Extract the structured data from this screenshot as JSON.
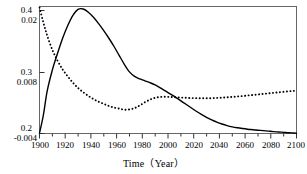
{
  "chart_data": {
    "type": "line",
    "title": "",
    "xlabel": "Time（Year）",
    "ylabel": "",
    "xlim": [
      1900,
      2100
    ],
    "xticks": [
      1900,
      1920,
      1940,
      1960,
      1980,
      2000,
      2020,
      2040,
      2060,
      2080,
      2100
    ],
    "xtick_labels": [
      "1900",
      "1920",
      "1940",
      "1960",
      "1980",
      "2000",
      "2020",
      "2040",
      "2060",
      "2080",
      "2100"
    ],
    "grid": false,
    "legend": "none",
    "axes": [
      {
        "name": "left-outer-axis",
        "ylim": [
          0.2,
          0.4
        ],
        "yticks": [
          0.2,
          0.3,
          0.4
        ],
        "ytick_labels": [
          "0.2",
          "0.3",
          "0.4"
        ],
        "series_ref": "solid-curve"
      },
      {
        "name": "left-inner-axis",
        "ylim": [
          -0.004,
          0.02
        ],
        "yticks": [
          -0.004,
          0.008,
          0.02
        ],
        "ytick_labels": [
          "-0.004",
          "0.008",
          "0.02"
        ],
        "series_ref": "dotted-curve"
      }
    ],
    "series": [
      {
        "name": "solid-curve",
        "style": "solid",
        "color": "#000000",
        "axis": "left-outer-axis",
        "x": [
          1900,
          1903,
          1906,
          1910,
          1914,
          1918,
          1922,
          1926,
          1930,
          1934,
          1938,
          1942,
          1946,
          1950,
          1954,
          1958,
          1962,
          1966,
          1970,
          1974,
          1978,
          1982,
          1986,
          1990,
          1994,
          1998,
          2002,
          2006,
          2010,
          2014,
          2018,
          2022,
          2026,
          2030,
          2034,
          2038,
          2042,
          2046,
          2050,
          2054,
          2058,
          2062,
          2066,
          2070,
          2074,
          2078,
          2082,
          2086,
          2090,
          2094,
          2098,
          2100
        ],
        "values": [
          0.2005,
          0.229,
          0.267,
          0.3,
          0.326,
          0.35,
          0.37,
          0.386,
          0.3955,
          0.396,
          0.391,
          0.383,
          0.373,
          0.362,
          0.35,
          0.337,
          0.323,
          0.309,
          0.297,
          0.29,
          0.286,
          0.283,
          0.28,
          0.2765,
          0.272,
          0.267,
          0.262,
          0.257,
          0.2515,
          0.246,
          0.2405,
          0.235,
          0.23,
          0.2255,
          0.2215,
          0.218,
          0.215,
          0.2125,
          0.2105,
          0.209,
          0.2078,
          0.2068,
          0.206,
          0.2052,
          0.2045,
          0.2038,
          0.203,
          0.2024,
          0.2018,
          0.2012,
          0.2008,
          0.2005
        ]
      },
      {
        "name": "dotted-curve",
        "style": "dotted",
        "color": "#000000",
        "axis": "left-inner-axis",
        "x": [
          1900,
          1903,
          1906,
          1910,
          1914,
          1918,
          1922,
          1926,
          1930,
          1934,
          1938,
          1942,
          1946,
          1950,
          1954,
          1958,
          1962,
          1966,
          1970,
          1974,
          1978,
          1982,
          1986,
          1990,
          1994,
          1998,
          2002,
          2006,
          2010,
          2014,
          2018,
          2022,
          2026,
          2030,
          2034,
          2038,
          2042,
          2046,
          2050,
          2054,
          2058,
          2062,
          2066,
          2070,
          2074,
          2078,
          2082,
          2086,
          2090,
          2094,
          2098,
          2100
        ],
        "values": [
          0.0198,
          0.017,
          0.0145,
          0.0118,
          0.0098,
          0.0081,
          0.0068,
          0.0056,
          0.0046,
          0.0038,
          0.0031,
          0.0025,
          0.002,
          0.0016,
          0.0012,
          0.0009,
          0.0007,
          0.0005,
          0.00055,
          0.0008,
          0.0013,
          0.0019,
          0.0024,
          0.00275,
          0.0029,
          0.00295,
          0.0029,
          0.00285,
          0.0028,
          0.00275,
          0.0027,
          0.00268,
          0.00266,
          0.00265,
          0.00268,
          0.00272,
          0.00278,
          0.00285,
          0.00292,
          0.003,
          0.00308,
          0.00318,
          0.00328,
          0.00338,
          0.00348,
          0.00358,
          0.00368,
          0.00378,
          0.00388,
          0.00398,
          0.00406,
          0.0041
        ]
      }
    ]
  },
  "axis_labels": {
    "y_outer": [
      "0.4",
      "0.3",
      "0.2"
    ],
    "y_inner": [
      "0.02",
      "0.008",
      "-0.004"
    ],
    "x": [
      "1900",
      "1920",
      "1940",
      "1960",
      "1980",
      "2000",
      "2020",
      "2040",
      "2060",
      "2080",
      "2100"
    ],
    "x_title": "Time（Year）"
  }
}
